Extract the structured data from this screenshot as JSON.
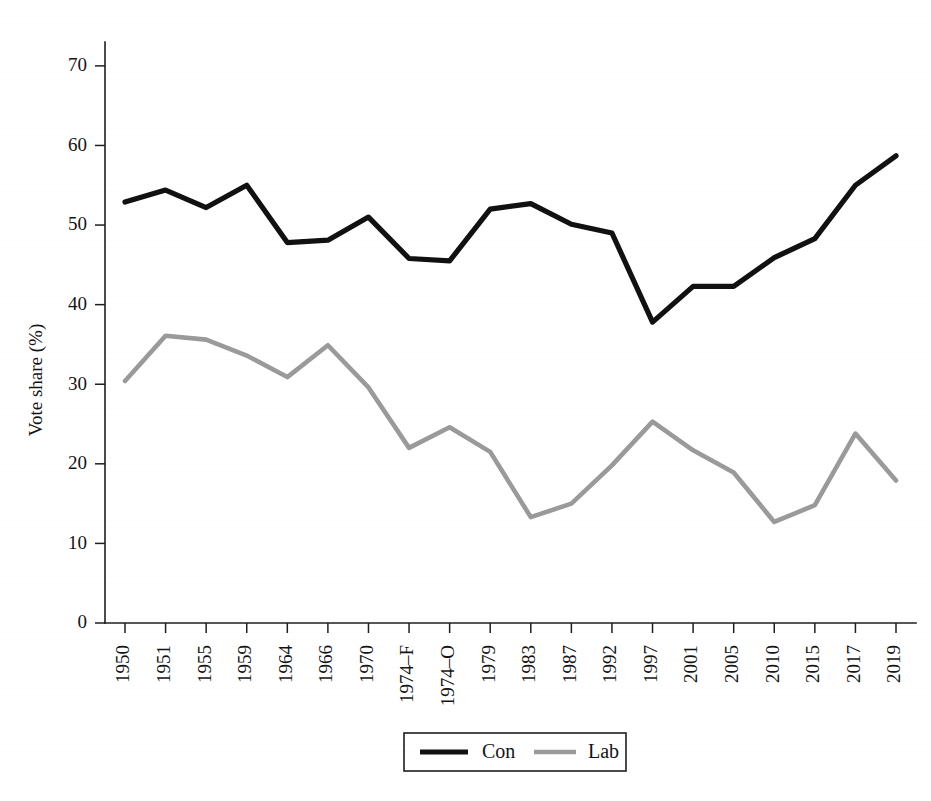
{
  "figure": {
    "background_color": "#ffffff",
    "con_color": "#111111",
    "lab_color": "#9a9a9a",
    "axis_color": "#1f1f1f"
  },
  "chart_data": {
    "type": "line",
    "title": "",
    "xlabel": "",
    "ylabel": "Vote share (%)",
    "ylim": [
      0,
      73
    ],
    "yticks": [
      0,
      10,
      20,
      30,
      40,
      50,
      60,
      70
    ],
    "ytick_labels": [
      "0",
      "10",
      "20",
      "30",
      "40",
      "50",
      "60",
      "70"
    ],
    "grid": false,
    "legend_position": "bottom-center",
    "categories": [
      "1950",
      "1951",
      "1955",
      "1959",
      "1964",
      "1966",
      "1970",
      "1974–F",
      "1974–O",
      "1979",
      "1983",
      "1987",
      "1992",
      "1997",
      "2001",
      "2005",
      "2010",
      "2015",
      "2017",
      "2019"
    ],
    "series": [
      {
        "name": "Con",
        "color": "#111111",
        "values": [
          52.9,
          54.4,
          52.2,
          55.0,
          47.8,
          48.1,
          51.0,
          45.8,
          45.5,
          52.0,
          52.7,
          50.1,
          49.0,
          37.8,
          42.3,
          42.3,
          45.9,
          48.3,
          55.0,
          58.7
        ]
      },
      {
        "name": "Lab",
        "color": "#9a9a9a",
        "values": [
          30.4,
          36.1,
          35.6,
          33.6,
          30.9,
          34.9,
          29.6,
          22.0,
          24.6,
          21.5,
          13.3,
          15.0,
          19.8,
          25.3,
          21.7,
          18.9,
          12.7,
          14.8,
          23.8,
          17.9
        ]
      }
    ]
  },
  "legend": {
    "items": [
      {
        "label": "Con",
        "style": "solid-black"
      },
      {
        "label": "Lab",
        "style": "solid-gray"
      }
    ]
  }
}
